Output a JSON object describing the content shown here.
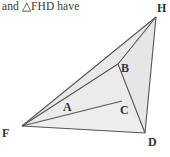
{
  "caption": {
    "text": "and △FHD have"
  },
  "figure": {
    "name": "triangle-fhd-diagram",
    "fill_color": "#ebebeb",
    "stroke_color": "#555555",
    "background_color": "#ffffff",
    "points": {
      "F": {
        "label": "F",
        "x": 22,
        "y": 126,
        "label_x": 2,
        "label_y": 127
      },
      "H": {
        "label": "H",
        "x": 156,
        "y": 17,
        "label_x": 157,
        "label_y": 2
      },
      "D": {
        "label": "D",
        "x": 145,
        "y": 133,
        "label_x": 148,
        "label_y": 136
      },
      "A": {
        "label": "A",
        "x": 73,
        "y": 116,
        "label_x": 63,
        "label_y": 101
      },
      "B": {
        "label": "B",
        "x": 118,
        "y": 64,
        "label_x": 121,
        "label_y": 62
      },
      "C": {
        "label": "C",
        "x": 122,
        "y": 101,
        "label_x": 120,
        "label_y": 104
      }
    },
    "segments": [
      {
        "name": "segment-F-H",
        "from": "F",
        "to": "H"
      },
      {
        "name": "segment-H-D",
        "from": "H",
        "to": "D"
      },
      {
        "name": "segment-F-D",
        "from": "F",
        "to": "D"
      },
      {
        "name": "segment-F-B-H",
        "from": "F",
        "to": "H",
        "via": "B"
      },
      {
        "name": "segment-F-C",
        "from": "F",
        "to": "C"
      },
      {
        "name": "segment-B-D",
        "from": "B",
        "to": "D"
      }
    ]
  }
}
